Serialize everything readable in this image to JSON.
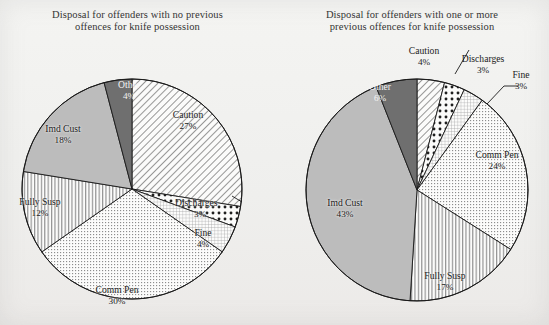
{
  "figure": {
    "background_color": "#f2f2f0",
    "outline_color": "#1a1a1a"
  },
  "chart_data": [
    {
      "type": "pie",
      "title": "Disposal for offenders with no previous offences for knife possession",
      "title_line1": "Disposal for offenders with no previous",
      "title_line2": "offences for knife possession",
      "xlabel": "",
      "ylabel": "",
      "start_angle_deg": 0,
      "direction": "clockwise",
      "legend": "none (labels on slices)",
      "categories": [
        "Caution",
        "Discharges",
        "Fine",
        "Comm Pen",
        "Fully Susp",
        "Imd Cust",
        "Other"
      ],
      "values": [
        27,
        3,
        4,
        30,
        12,
        18,
        4
      ],
      "value_labels": [
        "27%",
        "3%",
        "4%",
        "30%",
        "12%",
        "18%",
        "4%"
      ],
      "fills": [
        "diagonal-hatch",
        "polka-dots",
        "fine-grid",
        "fine-dots",
        "vertical-lines",
        "solid-light-grey",
        "solid-dark-grey"
      ],
      "colors": [
        "#ffffff",
        "#ffffff",
        "#ffffff",
        "#ffffff",
        "#ffffff",
        "#b9b9b9",
        "#6e6e6e"
      ]
    },
    {
      "type": "pie",
      "title": "Disposal for offenders with one or more previous offences for knife possession",
      "title_line1": "Disposal for offenders with one or more",
      "title_line2": "previous offences for knife possession",
      "xlabel": "",
      "ylabel": "",
      "start_angle_deg": 0,
      "direction": "clockwise",
      "legend": "none (labels on slices)",
      "categories": [
        "Caution",
        "Discharges",
        "Fine",
        "Comm Pen",
        "Fully Susp",
        "Imd Cust",
        "Other"
      ],
      "values": [
        4,
        3,
        3,
        24,
        17,
        43,
        6
      ],
      "value_labels": [
        "4%",
        "3%",
        "3%",
        "24%",
        "17%",
        "43%",
        "6%"
      ],
      "fills": [
        "diagonal-hatch",
        "polka-dots",
        "fine-grid",
        "fine-dots",
        "vertical-lines",
        "solid-light-grey",
        "solid-dark-grey"
      ],
      "colors": [
        "#ffffff",
        "#ffffff",
        "#ffffff",
        "#ffffff",
        "#ffffff",
        "#b9b9b9",
        "#6e6e6e"
      ]
    }
  ],
  "left": {
    "title_line1": "Disposal for offenders with no previous",
    "title_line2": "offences for knife possession",
    "labels": {
      "caution": "Caution",
      "caution_pct": "27%",
      "discharges": "Discharges",
      "discharges_pct": "3%",
      "fine": "Fine",
      "fine_pct": "4%",
      "comm_pen": "Comm Pen",
      "comm_pen_pct": "30%",
      "fully_susp": "Fully Susp",
      "fully_susp_pct": "12%",
      "imd_cust": "Imd Cust",
      "imd_cust_pct": "18%",
      "other": "Other",
      "other_pct": "4%"
    }
  },
  "right": {
    "title_line1": "Disposal for offenders with one or more",
    "title_line2": "previous offences for knife possession",
    "labels": {
      "caution": "Caution",
      "caution_pct": "4%",
      "discharges": "Discharges",
      "discharges_pct": "3%",
      "fine": "Fine",
      "fine_pct": "3%",
      "comm_pen": "Comm Pen",
      "comm_pen_pct": "24%",
      "fully_susp": "Fully Susp",
      "fully_susp_pct": "17%",
      "imd_cust": "Imd Cust",
      "imd_cust_pct": "43%",
      "other": "Other",
      "other_pct": "6%"
    }
  }
}
